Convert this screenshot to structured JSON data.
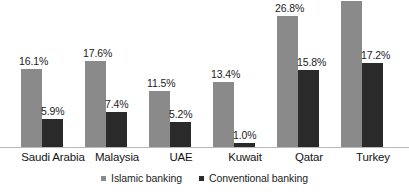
{
  "chart_data": {
    "type": "bar",
    "title": "",
    "xlabel": "",
    "ylabel": "",
    "ylim": [
      0,
      29.9
    ],
    "grid": false,
    "legend_position": "bottom",
    "categories": [
      "Saudi Arabia",
      "Malaysia",
      "UAE",
      "Kuwait",
      "Qatar",
      "Turkey"
    ],
    "series": [
      {
        "name": "Islamic banking",
        "color": "#8a8a8a",
        "values": [
          16.1,
          17.6,
          11.5,
          13.4,
          26.8,
          29.9
        ],
        "labels": [
          "16.1%",
          "17.6%",
          "11.5%",
          "13.4%",
          "26.8%",
          "29.9%"
        ]
      },
      {
        "name": "Conventional banking",
        "color": "#2a2a2a",
        "values": [
          5.9,
          7.4,
          5.2,
          1.0,
          15.8,
          17.2
        ],
        "labels": [
          "5.9%",
          "7.4%",
          "5.2%",
          "1.0%",
          "15.8%",
          "17.2%"
        ]
      }
    ]
  },
  "legend": {
    "items": [
      {
        "label": "Islamic banking",
        "color": "#8a8a8a"
      },
      {
        "label": "Conventional banking",
        "color": "#2a2a2a"
      }
    ]
  }
}
